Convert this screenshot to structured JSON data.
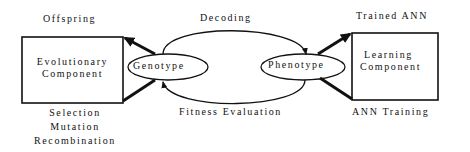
{
  "diagram": {
    "evolutionary_box": {
      "line1": "Evolutionary",
      "line2": "Component"
    },
    "learning_box": {
      "line1": "Learning",
      "line2": "Component"
    },
    "genotype": "Genotype",
    "phenotype": "Phenotype",
    "top_left_label": "Offspring",
    "bottom_left_labels": [
      "Selection",
      "Mutation",
      "Recombination"
    ],
    "top_right_label": "Trained ANN",
    "bottom_right_label": "ANN Training",
    "top_arc_label": "Decoding",
    "bottom_arc_label": "Fitness Evaluation",
    "colors": {
      "ink": "#111111",
      "background": "#ffffff"
    }
  }
}
